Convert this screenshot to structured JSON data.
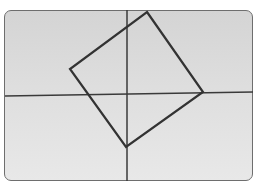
{
  "figure": {
    "axes": {
      "vertical": {
        "x": 127,
        "y1": 10,
        "y2": 181
      },
      "horizontal": {
        "x1": 5,
        "y1": 96,
        "x2": 253,
        "y2": 92
      }
    },
    "square": {
      "vertices": [
        [
          147,
          12
        ],
        [
          203,
          92
        ],
        [
          126,
          147
        ],
        [
          70,
          69
        ]
      ],
      "points": "147,12 203,92 126,147 70,69"
    },
    "colors": {
      "line": "#3a3a3a",
      "frame": "#6e6e6e",
      "background": "#dcdcdc"
    }
  }
}
